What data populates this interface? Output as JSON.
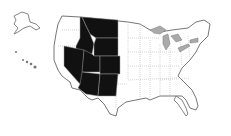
{
  "map": {
    "subject": "United States map",
    "highlighted_region": "Mountain West",
    "highlighted_states": [
      "Montana",
      "Idaho",
      "Wyoming",
      "Nevada",
      "Utah",
      "Colorado",
      "Arizona",
      "New Mexico"
    ],
    "colors": {
      "highlight": "#111111",
      "land": "#ffffff",
      "water": "#a8a8a8",
      "border": "#777777",
      "internal_border": "#cccccc"
    }
  }
}
